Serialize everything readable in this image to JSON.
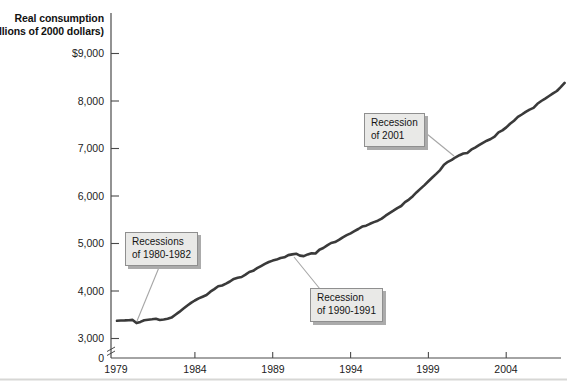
{
  "title": {
    "line1": "Real consumption",
    "line2": "(billions of 2000 dollars)"
  },
  "y_axis": {
    "tick_labels": [
      "$9,000",
      "8,000",
      "7,000",
      "6,000",
      "5,000",
      "4,000",
      "3,000",
      "0"
    ],
    "has_axis_break": true
  },
  "x_axis": {
    "tick_labels": [
      "1979",
      "1984",
      "1989",
      "1994",
      "1999",
      "2004"
    ]
  },
  "annotations": [
    {
      "line1": "Recessions",
      "line2": "of 1980-1982"
    },
    {
      "line1": "Recession",
      "line2": "of 1990-1991"
    },
    {
      "line1": "Recession",
      "line2": "of 2001"
    }
  ],
  "colors": {
    "line": "#3a3a3a",
    "axis": "#4a4a4a",
    "leader": "#a6a6a6",
    "callout_bg": "#e9e9e7",
    "callout_border": "#8f8f8f",
    "callout_shadow": "#ababab",
    "page_rule": "#d7d7d5"
  },
  "chart_data": {
    "type": "line",
    "title": "Real consumption (billions of 2000 dollars)",
    "xlabel": "Year",
    "ylabel": "Real consumption (billions of 2000 dollars)",
    "x_range": [
      1979,
      2007.75
    ],
    "y_ticks": [
      0,
      3000,
      4000,
      5000,
      6000,
      7000,
      8000,
      9000
    ],
    "x_ticks": [
      1979,
      1984,
      1989,
      1994,
      1999,
      2004
    ],
    "axis_break_below": 3000,
    "grid": false,
    "legend": "none",
    "annotations": [
      {
        "text": "Recessions of 1980-1982",
        "near_year": 1980.5
      },
      {
        "text": "Recession of 1990-1991",
        "near_year": 1990.5
      },
      {
        "text": "Recession of 2001",
        "near_year": 2001.0
      }
    ],
    "series": [
      {
        "name": "Real consumption",
        "unit": "billions of 2000 dollars",
        "frequency": "quarterly",
        "points": [
          [
            1979.0,
            3372
          ],
          [
            1979.25,
            3378
          ],
          [
            1979.5,
            3381
          ],
          [
            1979.75,
            3385
          ],
          [
            1980.0,
            3392
          ],
          [
            1980.25,
            3325
          ],
          [
            1980.5,
            3350
          ],
          [
            1980.75,
            3385
          ],
          [
            1981.0,
            3395
          ],
          [
            1981.25,
            3405
          ],
          [
            1981.5,
            3415
          ],
          [
            1981.75,
            3390
          ],
          [
            1982.0,
            3400
          ],
          [
            1982.25,
            3415
          ],
          [
            1982.5,
            3440
          ],
          [
            1982.75,
            3500
          ],
          [
            1983.0,
            3560
          ],
          [
            1983.25,
            3625
          ],
          [
            1983.5,
            3690
          ],
          [
            1983.75,
            3750
          ],
          [
            1984.0,
            3800
          ],
          [
            1984.25,
            3845
          ],
          [
            1984.5,
            3880
          ],
          [
            1984.75,
            3915
          ],
          [
            1985.0,
            3985
          ],
          [
            1985.25,
            4040
          ],
          [
            1985.5,
            4100
          ],
          [
            1985.75,
            4115
          ],
          [
            1986.0,
            4155
          ],
          [
            1986.25,
            4200
          ],
          [
            1986.5,
            4255
          ],
          [
            1986.75,
            4280
          ],
          [
            1987.0,
            4295
          ],
          [
            1987.25,
            4345
          ],
          [
            1987.5,
            4400
          ],
          [
            1987.75,
            4425
          ],
          [
            1988.0,
            4480
          ],
          [
            1988.25,
            4525
          ],
          [
            1988.5,
            4570
          ],
          [
            1988.75,
            4610
          ],
          [
            1989.0,
            4640
          ],
          [
            1989.25,
            4660
          ],
          [
            1989.5,
            4695
          ],
          [
            1989.75,
            4710
          ],
          [
            1990.0,
            4755
          ],
          [
            1990.25,
            4770
          ],
          [
            1990.5,
            4785
          ],
          [
            1990.75,
            4745
          ],
          [
            1991.0,
            4735
          ],
          [
            1991.25,
            4770
          ],
          [
            1991.5,
            4795
          ],
          [
            1991.75,
            4790
          ],
          [
            1992.0,
            4870
          ],
          [
            1992.25,
            4905
          ],
          [
            1992.5,
            4960
          ],
          [
            1992.75,
            5010
          ],
          [
            1993.0,
            5030
          ],
          [
            1993.25,
            5075
          ],
          [
            1993.5,
            5130
          ],
          [
            1993.75,
            5175
          ],
          [
            1994.0,
            5215
          ],
          [
            1994.25,
            5260
          ],
          [
            1994.5,
            5305
          ],
          [
            1994.75,
            5355
          ],
          [
            1995.0,
            5375
          ],
          [
            1995.25,
            5415
          ],
          [
            1995.5,
            5450
          ],
          [
            1995.75,
            5480
          ],
          [
            1996.0,
            5525
          ],
          [
            1996.25,
            5585
          ],
          [
            1996.5,
            5640
          ],
          [
            1996.75,
            5690
          ],
          [
            1997.0,
            5745
          ],
          [
            1997.25,
            5790
          ],
          [
            1997.5,
            5870
          ],
          [
            1997.75,
            5925
          ],
          [
            1998.0,
            5995
          ],
          [
            1998.25,
            6080
          ],
          [
            1998.5,
            6155
          ],
          [
            1998.75,
            6230
          ],
          [
            1999.0,
            6310
          ],
          [
            1999.25,
            6390
          ],
          [
            1999.5,
            6465
          ],
          [
            1999.75,
            6545
          ],
          [
            2000.0,
            6660
          ],
          [
            2000.25,
            6720
          ],
          [
            2000.5,
            6760
          ],
          [
            2000.75,
            6815
          ],
          [
            2001.0,
            6860
          ],
          [
            2001.25,
            6895
          ],
          [
            2001.5,
            6905
          ],
          [
            2001.75,
            6975
          ],
          [
            2002.0,
            7020
          ],
          [
            2002.25,
            7070
          ],
          [
            2002.5,
            7120
          ],
          [
            2002.75,
            7165
          ],
          [
            2003.0,
            7200
          ],
          [
            2003.25,
            7250
          ],
          [
            2003.5,
            7340
          ],
          [
            2003.75,
            7380
          ],
          [
            2004.0,
            7445
          ],
          [
            2004.25,
            7520
          ],
          [
            2004.5,
            7585
          ],
          [
            2004.75,
            7665
          ],
          [
            2005.0,
            7715
          ],
          [
            2005.25,
            7770
          ],
          [
            2005.5,
            7820
          ],
          [
            2005.75,
            7855
          ],
          [
            2006.0,
            7940
          ],
          [
            2006.25,
            8000
          ],
          [
            2006.5,
            8050
          ],
          [
            2006.75,
            8105
          ],
          [
            2007.0,
            8160
          ],
          [
            2007.25,
            8210
          ],
          [
            2007.5,
            8290
          ],
          [
            2007.75,
            8380
          ]
        ]
      }
    ]
  }
}
